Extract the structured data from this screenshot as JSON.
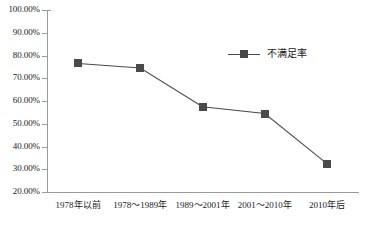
{
  "chart_data": {
    "type": "line",
    "title": "",
    "xlabel": "",
    "ylabel": "",
    "ylim": [
      20,
      100
    ],
    "grid": false,
    "legend_position": "top-right",
    "categories": [
      "1978年以前",
      "1978～1989年",
      "1989～2001年",
      "2001～2010年",
      "2010年后"
    ],
    "ytick_labels": [
      "100.00%",
      "90.00%",
      "80.00%",
      "70.00%",
      "60.00%",
      "50.00%",
      "40.00%",
      "30.00%",
      "20.00%"
    ],
    "ytick_values": [
      100,
      90,
      80,
      70,
      60,
      50,
      40,
      30,
      20
    ],
    "series": [
      {
        "name": "不满足率",
        "color": "#4a4a4a",
        "marker": "square",
        "values": [
          76.5,
          74.5,
          57.5,
          54.5,
          32.5
        ]
      }
    ]
  },
  "legend": {
    "entries": [
      {
        "label": "不满足率",
        "marker": "square-marker",
        "color": "#4a4a4a"
      }
    ]
  }
}
